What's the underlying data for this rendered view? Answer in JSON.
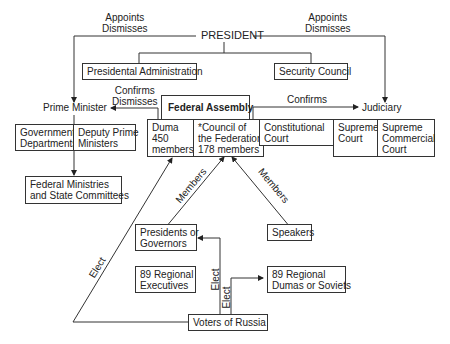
{
  "diagram": {
    "president": "PRESIDENT",
    "appoints_left": "Appoints",
    "dismisses_left": "Dismisses",
    "appoints_right": "Appoints",
    "dismisses_right": "Dismisses",
    "presidential_administration": "Presidental Administration",
    "security_council": "Security Council",
    "prime_minister": "Prime Minister",
    "confirms_pm": "Confirms",
    "dismisses_pm": "Dismisses",
    "judiciary": "Judiciary",
    "confirms_judiciary": "Confirms",
    "federal_assembly": "Federal Assembly",
    "government_departments": [
      "Government",
      "Departments"
    ],
    "deputy_prime_ministers": [
      "Deputy Prime",
      "Ministers"
    ],
    "federal_ministries": [
      "Federal Ministries",
      "and State Committees"
    ],
    "duma": [
      "Duma",
      "450",
      "members"
    ],
    "council_federation": [
      "*Council of",
      "the Federation",
      "178 members"
    ],
    "constitutional_court": [
      "Constitutional",
      "Court"
    ],
    "supreme_court": [
      "Supreme",
      "Court"
    ],
    "supreme_commercial_court": [
      "Supreme",
      "Commercial",
      "Court"
    ],
    "members_left": "Members",
    "members_right": "Members",
    "presidents_governors": [
      "Presidents or",
      "Governors"
    ],
    "speakers": "Speakers",
    "regional_executives": [
      "89 Regional",
      "Executives"
    ],
    "regional_dumas": [
      "89 Regional",
      "Dumas or Soviets"
    ],
    "elect_left": "Elect",
    "elect_mid1": "Elect",
    "elect_mid2": "Elect",
    "voters": "Voters of Russia"
  }
}
